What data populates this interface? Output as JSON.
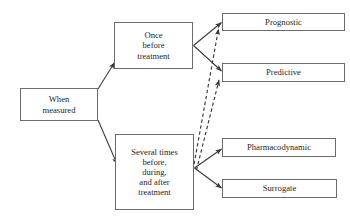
{
  "diagram": {
    "background_color": "#ffffff",
    "line_color": "#3a3636",
    "box_border_color": "#6e6a6a",
    "text_color": "#272323",
    "nodes": [
      {
        "id": "when_measured",
        "label": "When\nmeasured"
      },
      {
        "id": "once_before",
        "label": "Once\nbefore\ntreatment"
      },
      {
        "id": "several_times",
        "label": "Several times\nbefore,\nduring,\nand after\ntreatment"
      },
      {
        "id": "prognostic",
        "label": "Prognostic"
      },
      {
        "id": "predictive",
        "label": "Predictive"
      },
      {
        "id": "pharmacodynamic",
        "label": "Pharmacodynamic"
      },
      {
        "id": "surrogate",
        "label": "Surrogate"
      }
    ],
    "edges": [
      {
        "id": "e1",
        "from": "when_measured",
        "to": "once_before",
        "style": "solid"
      },
      {
        "id": "e2",
        "from": "when_measured",
        "to": "several_times",
        "style": "solid"
      },
      {
        "id": "e3",
        "from": "once_before",
        "to": "prognostic",
        "style": "solid"
      },
      {
        "id": "e4",
        "from": "once_before",
        "to": "predictive",
        "style": "solid"
      },
      {
        "id": "e5",
        "from": "several_times",
        "to": "pharmacodynamic",
        "style": "solid"
      },
      {
        "id": "e6",
        "from": "several_times",
        "to": "surrogate",
        "style": "solid"
      },
      {
        "id": "e7",
        "from": "several_times",
        "to": "prognostic",
        "style": "dashed"
      },
      {
        "id": "e8",
        "from": "several_times",
        "to": "predictive",
        "style": "dashed"
      }
    ]
  }
}
